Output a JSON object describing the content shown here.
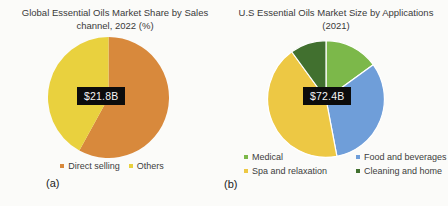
{
  "figure": {
    "panel_a": {
      "label": "(a)",
      "title_line1": "Global Essential Oils Market Share by Sales",
      "title_line2": "channel, 2022 (%)"
    },
    "panel_b": {
      "label": "(b)",
      "title_line1": "U.S Essential Oils Market Size by Applications",
      "title_line2": "(2021)"
    }
  },
  "chart_data": [
    {
      "type": "pie",
      "title": "Global Essential Oils Market Share by Sales channel, 2022 (%)",
      "center_label": "$21.8B",
      "units": "percent share",
      "start_angle": 0,
      "direction": "clockwise",
      "slice_border": 0,
      "legend_position": "bottom",
      "legend_columns": 1,
      "slices": [
        {
          "label": "Direct selling",
          "value": 58,
          "color": "#d8893c"
        },
        {
          "label": "Others",
          "value": 42,
          "color": "#e9d13e"
        }
      ]
    },
    {
      "type": "pie",
      "title": "U.S Essential Oils Market Size by Applications (2021)",
      "center_label": "$72.4B",
      "units": "percent of market size",
      "start_angle": 0,
      "direction": "clockwise",
      "slice_border": 1.2,
      "legend_position": "bottom",
      "legend_columns": 2,
      "slices": [
        {
          "label": "Medical",
          "value": 15,
          "color": "#7cb84a"
        },
        {
          "label": "Food and beverages",
          "value": 32,
          "color": "#6f9ed9"
        },
        {
          "label": "Spa and relaxation",
          "value": 43,
          "color": "#edc844"
        },
        {
          "label": "Cleaning and home",
          "value": 10,
          "color": "#41702f"
        }
      ]
    }
  ]
}
